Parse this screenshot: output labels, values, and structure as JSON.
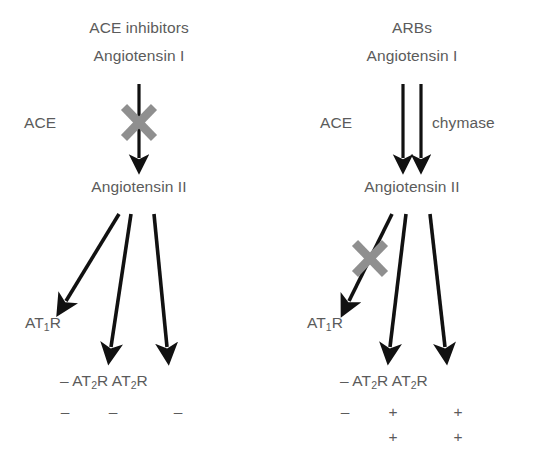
{
  "figure": {
    "background": "#ffffff",
    "text_color": "#5b5b5b",
    "arrow_color": "#111111",
    "block_color": "#8a8a8a"
  },
  "panels": [
    {
      "id": "left",
      "drug_label": "ACE inhibitors",
      "substrate_label": "Angiotensin I",
      "enzyme_left_label": "ACE",
      "enzyme_right_label": "",
      "product_label": "Angiotensin II",
      "conversion_arrows": 1,
      "conversion_blocked": true,
      "receptor_at1_label": "AT",
      "receptor_at1_sub": "1",
      "receptor_at1_suffix": "R",
      "at1_blocked": false,
      "receptor_row": {
        "lead_sign": "–",
        "at2_label": "AT",
        "at2_sub": "2",
        "at2_suffix": "R",
        "at2b_label": "AT",
        "at2b_sub": "2",
        "at2b_suffix": "R"
      },
      "effect_rows": [
        {
          "at1": "–",
          "at2": "–",
          "at2b": "–"
        }
      ]
    },
    {
      "id": "right",
      "drug_label": "ARBs",
      "substrate_label": "Angiotensin I",
      "enzyme_left_label": "ACE",
      "enzyme_right_label": "chymase",
      "product_label": "Angiotensin II",
      "conversion_arrows": 2,
      "conversion_blocked": false,
      "receptor_at1_label": "AT",
      "receptor_at1_sub": "1",
      "receptor_at1_suffix": "R",
      "at1_blocked": true,
      "receptor_row": {
        "lead_sign": "–",
        "at2_label": "AT",
        "at2_sub": "2",
        "at2_suffix": "R",
        "at2b_label": "AT",
        "at2b_sub": "2",
        "at2b_suffix": "R"
      },
      "effect_rows": [
        {
          "at1": "–",
          "at2": "+",
          "at2b": "+"
        },
        {
          "at1": "",
          "at2": "+",
          "at2b": "+"
        }
      ]
    }
  ]
}
